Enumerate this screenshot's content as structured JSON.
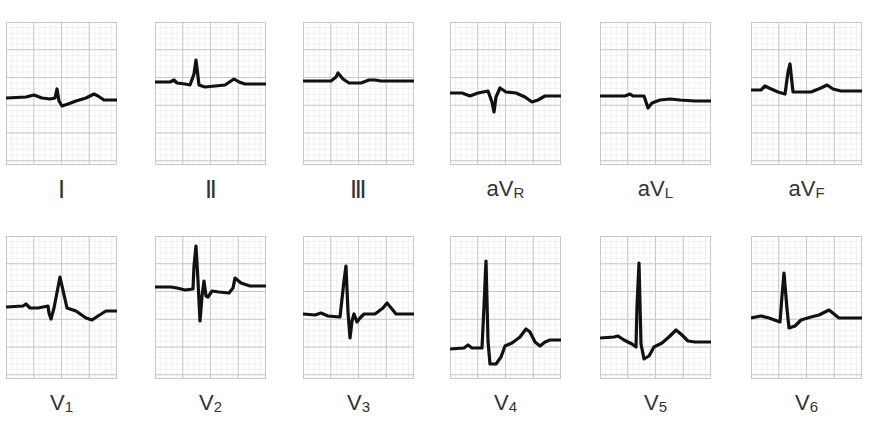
{
  "figure": {
    "title_cutoff": "",
    "grid": {
      "minor_color": "#e8e8e8",
      "major_color": "#c8c8c8",
      "major_divisions_x": 4,
      "major_divisions_y": 5
    },
    "trace_color": "#111111",
    "rows": [
      {
        "leads": [
          {
            "id": "I",
            "label": "Ⅰ",
            "style": "roman"
          },
          {
            "id": "II",
            "label": "Ⅱ",
            "style": "roman"
          },
          {
            "id": "III",
            "label": "Ⅲ",
            "style": "roman"
          },
          {
            "id": "aVR",
            "label_main": "aV",
            "label_sub": "R"
          },
          {
            "id": "aVL",
            "label_main": "aV",
            "label_sub": "L"
          },
          {
            "id": "aVF",
            "label_main": "aV",
            "label_sub": "F"
          }
        ]
      },
      {
        "leads": [
          {
            "id": "V1",
            "label_main": "V",
            "label_sub": "1"
          },
          {
            "id": "V2",
            "label_main": "V",
            "label_sub": "2"
          },
          {
            "id": "V3",
            "label_main": "V",
            "label_sub": "3"
          },
          {
            "id": "V4",
            "label_main": "V",
            "label_sub": "4"
          },
          {
            "id": "V5",
            "label_main": "V",
            "label_sub": "5"
          },
          {
            "id": "V6",
            "label_main": "V",
            "label_sub": "6"
          }
        ]
      }
    ]
  },
  "traces": {
    "I": "M0,76 L20,75 L28,73 L36,76 L44,77 L49,76 L51,67 L53,79 L56,84 L62,82 L70,79 L80,76 L88,72 L92,74 L98,78 L111,78",
    "II": "M0,60 L15,60 L19,58 L22,61 L30,62 L35,63 L39,52 L41,38 L44,63 L50,65 L60,64 L70,63 L79,57 L84,60 L90,62 L111,62",
    "III": "M0,59 L28,59 L33,55 L35,51 L40,57 L46,61 L58,61 L66,58 L72,58 L78,59 L111,59",
    "aVR": "M0,71 L12,71 L20,74 L28,71 L38,69 L42,80 L44,90 L46,75 L50,66 L56,70 L66,71 L75,75 L82,80 L88,78 L95,74 L111,74",
    "aVL": "M0,74 L25,74 L30,72 L33,74 L44,74 L46,80 L48,86 L52,81 L60,78 L70,77 L80,78 L95,79 L111,79",
    "aVF": "M0,68 L10,68 L14,64 L18,66 L27,70 L34,72 L37,50 L39,42 L42,70 L48,70 L60,70 L70,66 L76,63 L82,67 L90,69 L111,69",
    "V1": "M0,71 L17,70 L20,68 L24,72 L32,72 L42,70 L43,77 L45,83 L48,72 L54,41 L61,72 L70,75 L80,82 L86,84 L92,80 L100,75 L111,75",
    "V2": "M0,51 L16,51 L22,52 L30,54 L38,53 L39,30 L41,10 L43,45 L45,85 L47,60 L49,45 L51,60 L53,61 L57,55 L64,56 L74,57 L78,52 L80,42 L86,47 L95,50 L111,50",
    "V3": "M0,78 L12,79 L18,77 L25,80 L37,81 L41,45 L43,30 L45,76 L47,102 L49,85 L51,78 L54,86 L57,82 L61,78 L72,78 L80,72 L84,67 L89,73 L93,78 L111,78",
    "V4": "M0,113 L14,112 L18,109 L22,112 L32,112 L34,70 L36,25 L38,105 L40,128 L46,128 L51,121 L55,110 L62,107 L70,101 L76,93 L80,96 L85,106 L90,110 L95,106 L100,104 L111,104",
    "V5": "M0,102 L14,101 L18,100 L24,104 L32,108 L36,111 L37,70 L39,27 L41,108 L44,123 L49,120 L54,111 L62,107 L70,100 L76,94 L82,99 L88,105 L95,106 L111,106",
    "V6": "M0,82 L10,80 L18,82 L29,86 L31,60 L33,37 L36,73 L38,92 L44,90 L50,84 L60,81 L68,79 L74,76 L78,74 L83,78 L88,82 L111,82"
  }
}
